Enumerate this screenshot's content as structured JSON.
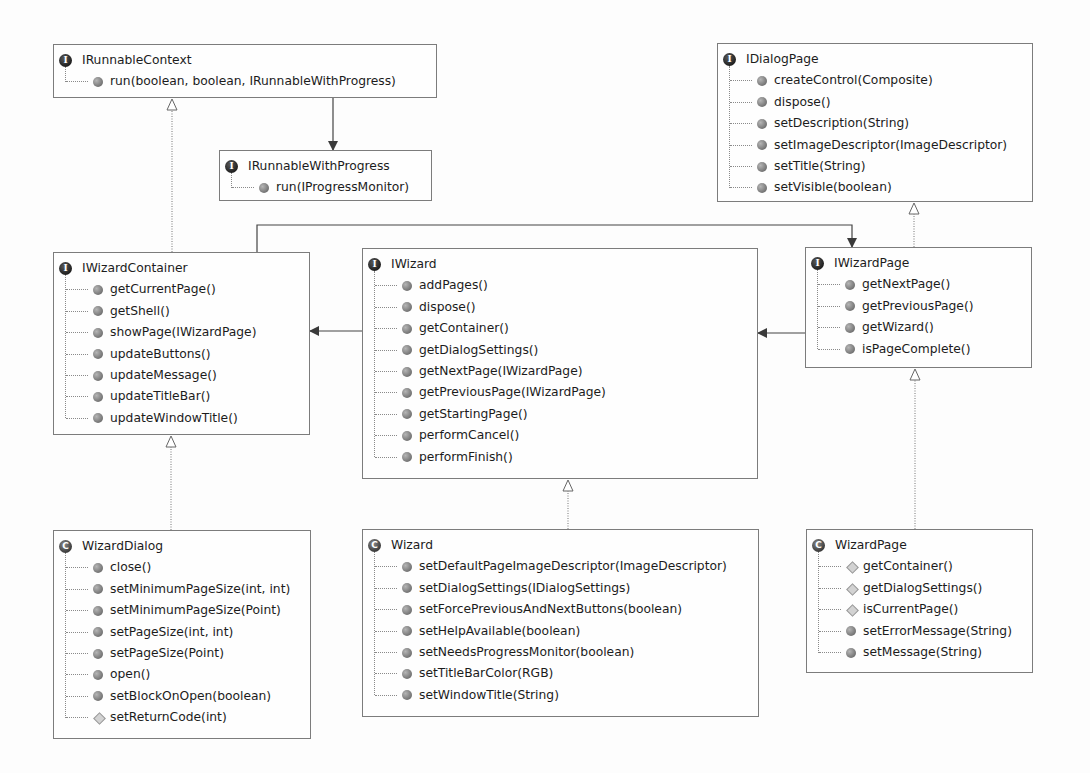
{
  "diagram": {
    "classifiers": [
      {
        "id": "IRunnableContext",
        "kind": "interface",
        "icon": "I",
        "name": "IRunnableContext",
        "members": [
          {
            "name": "run(boolean, boolean, IRunnableWithProgress)",
            "visibility": "public"
          }
        ]
      },
      {
        "id": "IRunnableWithProgress",
        "kind": "interface",
        "icon": "I",
        "name": "IRunnableWithProgress",
        "members": [
          {
            "name": "run(IProgressMonitor)",
            "visibility": "public"
          }
        ]
      },
      {
        "id": "IDialogPage",
        "kind": "interface",
        "icon": "I",
        "name": "IDialogPage",
        "members": [
          {
            "name": "createControl(Composite)",
            "visibility": "public"
          },
          {
            "name": "dispose()",
            "visibility": "public"
          },
          {
            "name": "setDescription(String)",
            "visibility": "public"
          },
          {
            "name": "setImageDescriptor(ImageDescriptor)",
            "visibility": "public"
          },
          {
            "name": "setTitle(String)",
            "visibility": "public"
          },
          {
            "name": "setVisible(boolean)",
            "visibility": "public"
          }
        ]
      },
      {
        "id": "IWizardContainer",
        "kind": "interface",
        "icon": "I",
        "name": "IWizardContainer",
        "members": [
          {
            "name": "getCurrentPage()",
            "visibility": "public"
          },
          {
            "name": "getShell()",
            "visibility": "public"
          },
          {
            "name": "showPage(IWizardPage)",
            "visibility": "public"
          },
          {
            "name": "updateButtons()",
            "visibility": "public"
          },
          {
            "name": "updateMessage()",
            "visibility": "public"
          },
          {
            "name": "updateTitleBar()",
            "visibility": "public"
          },
          {
            "name": "updateWindowTitle()",
            "visibility": "public"
          }
        ]
      },
      {
        "id": "IWizard",
        "kind": "interface",
        "icon": "I",
        "name": "IWizard",
        "members": [
          {
            "name": "addPages()",
            "visibility": "public"
          },
          {
            "name": "dispose()",
            "visibility": "public"
          },
          {
            "name": "getContainer()",
            "visibility": "public"
          },
          {
            "name": "getDialogSettings()",
            "visibility": "public"
          },
          {
            "name": "getNextPage(IWizardPage)",
            "visibility": "public"
          },
          {
            "name": "getPreviousPage(IWizardPage)",
            "visibility": "public"
          },
          {
            "name": "getStartingPage()",
            "visibility": "public"
          },
          {
            "name": "performCancel()",
            "visibility": "public"
          },
          {
            "name": "performFinish()",
            "visibility": "public"
          }
        ]
      },
      {
        "id": "IWizardPage",
        "kind": "interface",
        "icon": "I",
        "name": "IWizardPage",
        "members": [
          {
            "name": "getNextPage()",
            "visibility": "public"
          },
          {
            "name": "getPreviousPage()",
            "visibility": "public"
          },
          {
            "name": "getWizard()",
            "visibility": "public"
          },
          {
            "name": "isPageComplete()",
            "visibility": "public"
          }
        ]
      },
      {
        "id": "WizardDialog",
        "kind": "class",
        "icon": "C",
        "name": "WizardDialog",
        "members": [
          {
            "name": "close()",
            "visibility": "public"
          },
          {
            "name": "setMinimumPageSize(int, int)",
            "visibility": "public"
          },
          {
            "name": "setMinimumPageSize(Point)",
            "visibility": "public"
          },
          {
            "name": "setPageSize(int, int)",
            "visibility": "public"
          },
          {
            "name": "setPageSize(Point)",
            "visibility": "public"
          },
          {
            "name": "open()",
            "visibility": "public"
          },
          {
            "name": "setBlockOnOpen(boolean)",
            "visibility": "public"
          },
          {
            "name": "setReturnCode(int)",
            "visibility": "protected"
          }
        ]
      },
      {
        "id": "Wizard",
        "kind": "class",
        "icon": "C",
        "name": "Wizard",
        "members": [
          {
            "name": "setDefaultPageImageDescriptor(ImageDescriptor)",
            "visibility": "public"
          },
          {
            "name": "setDialogSettings(IDialogSettings)",
            "visibility": "public"
          },
          {
            "name": "setForcePreviousAndNextButtons(boolean)",
            "visibility": "public"
          },
          {
            "name": "setHelpAvailable(boolean)",
            "visibility": "public"
          },
          {
            "name": "setNeedsProgressMonitor(boolean)",
            "visibility": "public"
          },
          {
            "name": "setTitleBarColor(RGB)",
            "visibility": "public"
          },
          {
            "name": "setWindowTitle(String)",
            "visibility": "public"
          }
        ]
      },
      {
        "id": "WizardPage",
        "kind": "class",
        "icon": "C",
        "name": "WizardPage",
        "members": [
          {
            "name": "getContainer()",
            "visibility": "protected"
          },
          {
            "name": "getDialogSettings()",
            "visibility": "protected"
          },
          {
            "name": "isCurrentPage()",
            "visibility": "protected"
          },
          {
            "name": "setErrorMessage(String)",
            "visibility": "public"
          },
          {
            "name": "setMessage(String)",
            "visibility": "public"
          }
        ]
      }
    ],
    "relations": [
      {
        "type": "realization",
        "from": "IWizardContainer",
        "to": "IRunnableContext"
      },
      {
        "type": "association",
        "from": "IRunnableContext.run",
        "to": "IRunnableWithProgress"
      },
      {
        "type": "realization",
        "from": "IWizardPage",
        "to": "IDialogPage"
      },
      {
        "type": "realization",
        "from": "WizardDialog",
        "to": "IWizardContainer"
      },
      {
        "type": "realization",
        "from": "Wizard",
        "to": "IWizard"
      },
      {
        "type": "realization",
        "from": "WizardPage",
        "to": "IWizardPage"
      },
      {
        "type": "association",
        "from": "IWizardContainer.getCurrentPage",
        "to": "IWizardPage"
      },
      {
        "type": "association",
        "from": "IWizard.getContainer",
        "to": "IWizardContainer"
      },
      {
        "type": "association",
        "from": "IWizardPage.getWizard",
        "to": "IWizard"
      }
    ],
    "colors": {
      "background": "#fdfdfd",
      "border": "#7c7c7c",
      "line": "#555555",
      "text": "#1c1c1c"
    }
  }
}
